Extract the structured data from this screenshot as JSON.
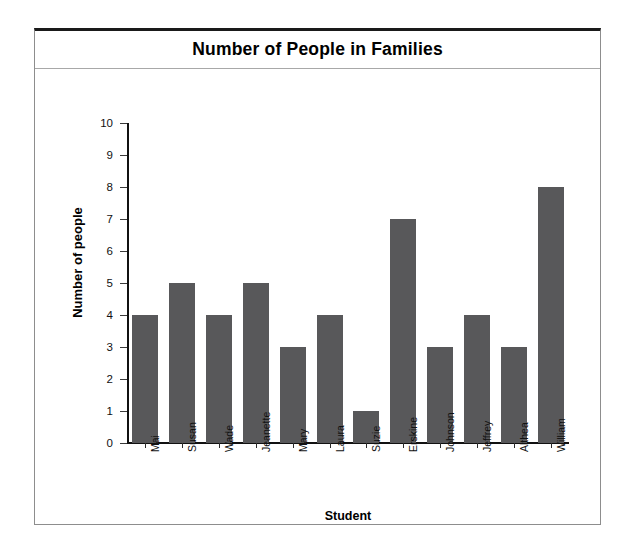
{
  "figure": {
    "title": "Number of People in Families",
    "frame_color": "#8d8d8d",
    "bar_color": "#58585a",
    "axis_color": "#111111"
  },
  "chart_data": {
    "type": "bar",
    "title": "Number of People in Families",
    "xlabel": "Student",
    "ylabel": "Number of people",
    "categories": [
      "Mai",
      "Susan",
      "Wade",
      "Jeanette",
      "Mary",
      "Laura",
      "Suzie",
      "Erskine",
      "Johnson",
      "Jeffrey",
      "Althea",
      "William"
    ],
    "values": [
      4,
      5,
      4,
      5,
      3,
      4,
      1,
      7,
      3,
      4,
      3,
      8
    ],
    "ylim": [
      0,
      10
    ],
    "ytick_labels": [
      "10",
      "9",
      "8",
      "7",
      "6",
      "5",
      "4",
      "3",
      "2",
      "1",
      "0"
    ],
    "ytick_values": [
      10,
      9,
      8,
      7,
      6,
      5,
      4,
      3,
      2,
      1,
      0
    ],
    "grid": false,
    "legend": false
  }
}
